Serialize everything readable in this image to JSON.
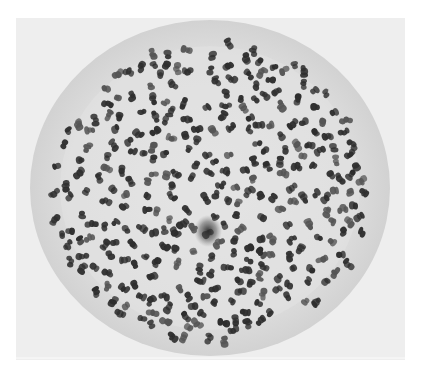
{
  "image": {
    "type": "micrograph",
    "subject": "Metaphase chromosome spread in a cell, viewed from the pole (light microscopy, black and white)",
    "description": "Circular cell containing several hundred dark, small condensed chromosomes scattered evenly, with a dark central spot (centrosome region)",
    "colors": {
      "background": "#eeeeee",
      "cell": "#d9d9d9",
      "cell_inner": "#e2e2e2",
      "chromosome": "#2e2e2e",
      "chromosome_light": "#555555",
      "center_spot": "#3a3a3a",
      "page": "#ffffff"
    }
  }
}
